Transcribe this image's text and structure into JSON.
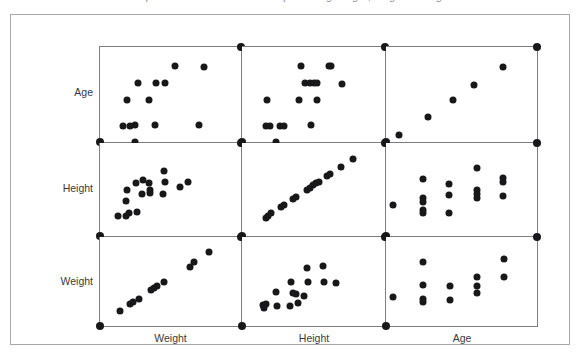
{
  "caption": {
    "text": "Scatterplot matrix of the relationships among weight, height and age"
  },
  "figure": {
    "title": "Scatterplot Matrix",
    "row_labels": [
      "Age",
      "Height",
      "Weight"
    ],
    "col_labels": [
      "Weight",
      "Height",
      "Age"
    ],
    "frame_color": "#a7a7aa",
    "panel_border_color": "#7d7d82",
    "point_color": "#18181a",
    "background": "#ffffff"
  },
  "chart_data": {
    "type": "scatter",
    "title": "Scatterplot matrix of the relationships among weight, height and age",
    "layout": "matrix-3x3",
    "variables": [
      "Weight",
      "Height",
      "Age"
    ],
    "rows": [
      "Age",
      "Height",
      "Weight"
    ],
    "columns": [
      "Weight",
      "Height",
      "Age"
    ],
    "grid": false,
    "legend": "none",
    "axis_tick_labels": "none",
    "note": "Each panel plots the row variable (y) against the column variable (x). Values below are normalized 0-1 within each panel's axis range. Corner markers mark each panel's axis extremes.",
    "corner_markers": [
      {
        "x": 0.0,
        "y": 0.0
      },
      {
        "x": 1.0,
        "y": 1.0
      }
    ],
    "panels": [
      {
        "row": "Age",
        "col": "Weight",
        "r": 0,
        "c": 0,
        "relationship": "positive, discrete age bands",
        "points": [
          {
            "x": 0.16,
            "y": 0.17
          },
          {
            "x": 0.215,
            "y": 0.17
          },
          {
            "x": 0.245,
            "y": 0.175
          },
          {
            "x": 0.39,
            "y": 0.175
          },
          {
            "x": 0.7,
            "y": 0.175
          },
          {
            "x": 0.195,
            "y": 0.44
          },
          {
            "x": 0.345,
            "y": 0.44
          },
          {
            "x": 0.27,
            "y": 0.62
          },
          {
            "x": 0.395,
            "y": 0.62
          },
          {
            "x": 0.46,
            "y": 0.62
          },
          {
            "x": 0.535,
            "y": 0.8
          },
          {
            "x": 0.735,
            "y": 0.79
          },
          {
            "x": 0.245,
            "y": 0.005
          }
        ]
      },
      {
        "row": "Age",
        "col": "Height",
        "r": 0,
        "c": 1,
        "relationship": "positive, discrete age bands",
        "points": [
          {
            "x": 0.165,
            "y": 0.17
          },
          {
            "x": 0.195,
            "y": 0.17
          },
          {
            "x": 0.265,
            "y": 0.17
          },
          {
            "x": 0.295,
            "y": 0.17
          },
          {
            "x": 0.48,
            "y": 0.175
          },
          {
            "x": 0.175,
            "y": 0.44
          },
          {
            "x": 0.4,
            "y": 0.44
          },
          {
            "x": 0.525,
            "y": 0.44
          },
          {
            "x": 0.44,
            "y": 0.62
          },
          {
            "x": 0.475,
            "y": 0.62
          },
          {
            "x": 0.5,
            "y": 0.62
          },
          {
            "x": 0.525,
            "y": 0.62
          },
          {
            "x": 0.7,
            "y": 0.61
          },
          {
            "x": 0.415,
            "y": 0.8
          },
          {
            "x": 0.61,
            "y": 0.8
          },
          {
            "x": 0.625,
            "y": 0.8
          },
          {
            "x": 0.235,
            "y": 0.005
          }
        ]
      },
      {
        "row": "Age",
        "col": "Age",
        "r": 0,
        "c": 2,
        "relationship": "identity diagonal",
        "points": [
          {
            "x": 0.085,
            "y": 0.075
          },
          {
            "x": 0.275,
            "y": 0.26
          },
          {
            "x": 0.445,
            "y": 0.44
          },
          {
            "x": 0.585,
            "y": 0.6
          },
          {
            "x": 0.775,
            "y": 0.79
          }
        ]
      },
      {
        "row": "Height",
        "col": "Weight",
        "r": 1,
        "c": 0,
        "relationship": "positive, curvilinear with scatter",
        "points": [
          {
            "x": 0.125,
            "y": 0.215
          },
          {
            "x": 0.185,
            "y": 0.22
          },
          {
            "x": 0.205,
            "y": 0.245
          },
          {
            "x": 0.185,
            "y": 0.375
          },
          {
            "x": 0.265,
            "y": 0.255
          },
          {
            "x": 0.195,
            "y": 0.5
          },
          {
            "x": 0.255,
            "y": 0.565
          },
          {
            "x": 0.305,
            "y": 0.6
          },
          {
            "x": 0.295,
            "y": 0.45
          },
          {
            "x": 0.345,
            "y": 0.565
          },
          {
            "x": 0.355,
            "y": 0.5
          },
          {
            "x": 0.355,
            "y": 0.46
          },
          {
            "x": 0.445,
            "y": 0.455
          },
          {
            "x": 0.455,
            "y": 0.7
          },
          {
            "x": 0.46,
            "y": 0.585
          },
          {
            "x": 0.565,
            "y": 0.53
          },
          {
            "x": 0.625,
            "y": 0.585
          }
        ]
      },
      {
        "row": "Height",
        "col": "Height",
        "r": 1,
        "c": 1,
        "relationship": "identity diagonal",
        "points": [
          {
            "x": 0.165,
            "y": 0.195
          },
          {
            "x": 0.185,
            "y": 0.22
          },
          {
            "x": 0.205,
            "y": 0.245
          },
          {
            "x": 0.275,
            "y": 0.315
          },
          {
            "x": 0.295,
            "y": 0.335
          },
          {
            "x": 0.355,
            "y": 0.4
          },
          {
            "x": 0.375,
            "y": 0.42
          },
          {
            "x": 0.455,
            "y": 0.5
          },
          {
            "x": 0.475,
            "y": 0.52
          },
          {
            "x": 0.495,
            "y": 0.545
          },
          {
            "x": 0.515,
            "y": 0.565
          },
          {
            "x": 0.535,
            "y": 0.585
          },
          {
            "x": 0.595,
            "y": 0.645
          },
          {
            "x": 0.615,
            "y": 0.665
          },
          {
            "x": 0.695,
            "y": 0.745
          },
          {
            "x": 0.775,
            "y": 0.825
          }
        ]
      },
      {
        "row": "Height",
        "col": "Age",
        "r": 1,
        "c": 2,
        "relationship": "positive, discrete age columns",
        "points": [
          {
            "x": 0.045,
            "y": 0.33
          },
          {
            "x": 0.245,
            "y": 0.61
          },
          {
            "x": 0.245,
            "y": 0.41
          },
          {
            "x": 0.245,
            "y": 0.37
          },
          {
            "x": 0.245,
            "y": 0.28
          },
          {
            "x": 0.245,
            "y": 0.245
          },
          {
            "x": 0.42,
            "y": 0.555
          },
          {
            "x": 0.42,
            "y": 0.44
          },
          {
            "x": 0.42,
            "y": 0.25
          },
          {
            "x": 0.605,
            "y": 0.735
          },
          {
            "x": 0.605,
            "y": 0.5
          },
          {
            "x": 0.605,
            "y": 0.455
          },
          {
            "x": 0.605,
            "y": 0.41
          },
          {
            "x": 0.775,
            "y": 0.62
          },
          {
            "x": 0.775,
            "y": 0.585
          },
          {
            "x": 0.775,
            "y": 0.435
          }
        ]
      },
      {
        "row": "Weight",
        "col": "Weight",
        "r": 2,
        "c": 0,
        "relationship": "identity diagonal",
        "points": [
          {
            "x": 0.145,
            "y": 0.17
          },
          {
            "x": 0.215,
            "y": 0.245
          },
          {
            "x": 0.235,
            "y": 0.265
          },
          {
            "x": 0.275,
            "y": 0.3
          },
          {
            "x": 0.365,
            "y": 0.405
          },
          {
            "x": 0.385,
            "y": 0.425
          },
          {
            "x": 0.405,
            "y": 0.445
          },
          {
            "x": 0.455,
            "y": 0.5
          },
          {
            "x": 0.635,
            "y": 0.665
          },
          {
            "x": 0.665,
            "y": 0.715
          },
          {
            "x": 0.775,
            "y": 0.835
          }
        ]
      },
      {
        "row": "Weight",
        "col": "Height",
        "r": 2,
        "c": 1,
        "relationship": "positive with scatter",
        "points": [
          {
            "x": 0.145,
            "y": 0.235
          },
          {
            "x": 0.155,
            "y": 0.205
          },
          {
            "x": 0.17,
            "y": 0.245
          },
          {
            "x": 0.245,
            "y": 0.225
          },
          {
            "x": 0.235,
            "y": 0.385
          },
          {
            "x": 0.335,
            "y": 0.23
          },
          {
            "x": 0.345,
            "y": 0.495
          },
          {
            "x": 0.355,
            "y": 0.37
          },
          {
            "x": 0.375,
            "y": 0.365
          },
          {
            "x": 0.395,
            "y": 0.26
          },
          {
            "x": 0.435,
            "y": 0.335
          },
          {
            "x": 0.455,
            "y": 0.655
          },
          {
            "x": 0.465,
            "y": 0.49
          },
          {
            "x": 0.565,
            "y": 0.675
          },
          {
            "x": 0.575,
            "y": 0.49
          },
          {
            "x": 0.655,
            "y": 0.485
          }
        ]
      },
      {
        "row": "Weight",
        "col": "Age",
        "r": 2,
        "c": 2,
        "relationship": "positive, discrete age columns",
        "points": [
          {
            "x": 0.045,
            "y": 0.325
          },
          {
            "x": 0.245,
            "y": 0.72
          },
          {
            "x": 0.245,
            "y": 0.46
          },
          {
            "x": 0.245,
            "y": 0.3
          },
          {
            "x": 0.245,
            "y": 0.265
          },
          {
            "x": 0.425,
            "y": 0.45
          },
          {
            "x": 0.425,
            "y": 0.295
          },
          {
            "x": 0.605,
            "y": 0.555
          },
          {
            "x": 0.605,
            "y": 0.455
          },
          {
            "x": 0.605,
            "y": 0.37
          },
          {
            "x": 0.78,
            "y": 0.75
          },
          {
            "x": 0.78,
            "y": 0.555
          }
        ]
      }
    ]
  }
}
